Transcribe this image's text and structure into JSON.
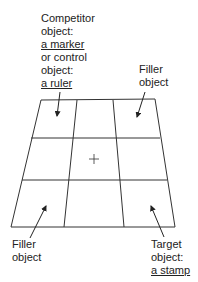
{
  "labels": {
    "competitor": {
      "line1": "Competitor",
      "line2": "object:",
      "line3": "a marker",
      "line4": "or control",
      "line5": "object:",
      "line6": "a ruler"
    },
    "filler_top": {
      "line1": "Filler",
      "line2": "object"
    },
    "filler_bottom": {
      "line1": "Filler",
      "line2": "object"
    },
    "target": {
      "line1": "Target",
      "line2": "object:",
      "line3": "a stamp"
    }
  },
  "grid": {
    "rows": 3,
    "cols": 3,
    "center_marker": "+",
    "stroke_color": "#333333"
  }
}
